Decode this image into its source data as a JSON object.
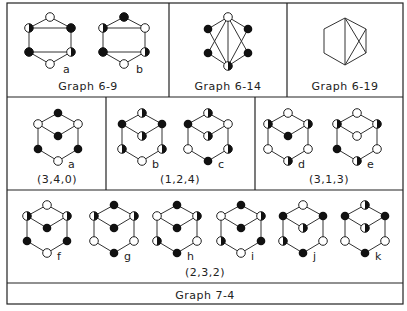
{
  "panels": {
    "g6_9": {
      "caption": "Graph 6-9",
      "labels": [
        "a",
        "b"
      ]
    },
    "g6_14": {
      "caption": "Graph 6-14"
    },
    "g6_19": {
      "caption": "Graph 6-19"
    },
    "g340": {
      "caption": "(3,4,0)",
      "labels": [
        "a"
      ]
    },
    "g124": {
      "caption": "(1,2,4)",
      "labels": [
        "b",
        "c"
      ]
    },
    "g313": {
      "caption": "(3,1,3)",
      "labels": [
        "d",
        "e"
      ]
    },
    "g232": {
      "caption": "(2,3,2)",
      "labels": [
        "f",
        "g",
        "h",
        "i",
        "j",
        "k"
      ]
    },
    "footer": {
      "caption": "Graph 7-4"
    }
  },
  "node_legend": {
    "open": "white circle",
    "filled": "black circle",
    "half": "half-filled circle"
  },
  "cubes": {
    "node_order": [
      "top",
      "upper-left",
      "upper-right",
      "center",
      "lower-left",
      "lower-right",
      "bottom"
    ],
    "a": [
      "filled",
      "open",
      "open",
      "filled",
      "filled",
      "filled",
      "open"
    ],
    "b": [
      "half",
      "filled",
      "filled",
      "half",
      "half",
      "half",
      "open"
    ],
    "c": [
      "half",
      "filled",
      "open",
      "half",
      "open",
      "half",
      "filled"
    ],
    "d": [
      "open",
      "half",
      "half",
      "filled",
      "open",
      "open",
      "half"
    ],
    "e": [
      "open",
      "half",
      "half",
      "open",
      "filled",
      "open",
      "half"
    ],
    "f": [
      "open",
      "half",
      "half",
      "filled",
      "filled",
      "filled",
      "open"
    ],
    "g": [
      "filled",
      "half",
      "half",
      "filled",
      "open",
      "open",
      "filled"
    ],
    "h": [
      "filled",
      "open",
      "half",
      "filled",
      "half",
      "open",
      "filled"
    ],
    "i": [
      "filled",
      "open",
      "half",
      "filled",
      "half",
      "filled",
      "open"
    ],
    "j": [
      "open",
      "filled",
      "filled",
      "half",
      "half",
      "open",
      "filled"
    ],
    "k": [
      "half",
      "filled",
      "filled",
      "half",
      "open",
      "open",
      "filled"
    ]
  }
}
